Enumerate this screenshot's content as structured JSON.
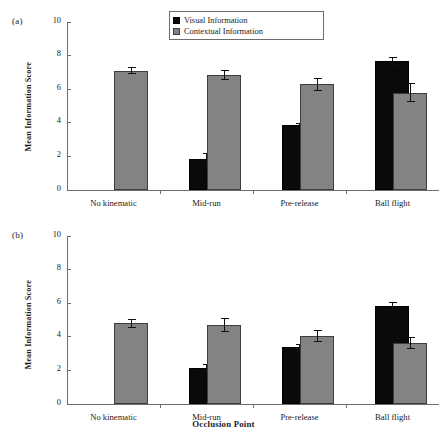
{
  "figure": {
    "panels": [
      {
        "tag": "(a)"
      },
      {
        "tag": "(b)"
      }
    ],
    "legend": {
      "entries": [
        {
          "label": "Visual Information",
          "color": "#0a0a0a",
          "icon": "legend-swatch-black"
        },
        {
          "label": "Contextual Information",
          "color": "#838383",
          "icon": "legend-swatch-gray"
        }
      ]
    },
    "xtitle": "Occlusion Point",
    "ylabel": "Mean Information Score"
  },
  "chart_data": [
    {
      "type": "bar",
      "panel": "(a)",
      "title": "",
      "xlabel": "Occlusion Point",
      "ylabel": "Mean Information Score",
      "categories": [
        "No kinematic",
        "Mid-run",
        "Pre-release",
        "Ball flight"
      ],
      "ylim": [
        0,
        10
      ],
      "yticks": [
        0,
        2,
        4,
        6,
        8,
        10
      ],
      "ytick_labels": [
        "0",
        "2",
        "4",
        "6",
        "8",
        "10"
      ],
      "grid": false,
      "legend_position": "top-center",
      "series": [
        {
          "name": "Visual Information",
          "color": "#0a0a0a",
          "values": [
            null,
            1.85,
            3.85,
            7.65
          ],
          "errors": [
            null,
            0.38,
            0.15,
            0.25
          ]
        },
        {
          "name": "Contextual Information",
          "color": "#838383",
          "values": [
            7.1,
            6.85,
            6.3,
            5.8
          ],
          "errors": [
            0.22,
            0.28,
            0.38,
            0.55
          ]
        }
      ]
    },
    {
      "type": "bar",
      "panel": "(b)",
      "title": "",
      "xlabel": "Occlusion Point",
      "ylabel": "Mean Information Score",
      "categories": [
        "No kinematic",
        "Mid-run",
        "Pre-release",
        "Ball flight"
      ],
      "ylim": [
        0,
        10
      ],
      "yticks": [
        0,
        2,
        4,
        6,
        8,
        10
      ],
      "ytick_labels": [
        "0",
        "2",
        "4",
        "6",
        "8",
        "10"
      ],
      "grid": false,
      "legend_position": "none",
      "series": [
        {
          "name": "Visual Information",
          "color": "#0a0a0a",
          "values": [
            null,
            2.15,
            3.4,
            5.85
          ],
          "errors": [
            null,
            0.25,
            0.15,
            0.25
          ]
        },
        {
          "name": "Contextual Information",
          "color": "#838383",
          "values": [
            4.8,
            4.7,
            4.05,
            3.65
          ],
          "errors": [
            0.28,
            0.4,
            0.35,
            0.35
          ]
        }
      ]
    }
  ]
}
